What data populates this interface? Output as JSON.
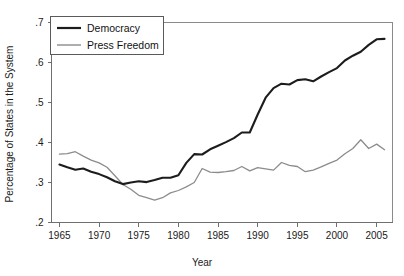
{
  "chart_data": {
    "type": "line",
    "title": "",
    "xlabel": "Year",
    "ylabel": "Percentage of States in the System",
    "xlim": [
      1964,
      2007
    ],
    "ylim": [
      0.2,
      0.7
    ],
    "grid": false,
    "legend_position": "top-left",
    "xticks": [
      1965,
      1970,
      1975,
      1980,
      1985,
      1990,
      1995,
      2000,
      2005
    ],
    "xtick_labels": [
      "1965",
      "1970",
      "1975",
      "1980",
      "1985",
      "1990",
      "1995",
      "2000",
      "2005"
    ],
    "yticks": [
      0.2,
      0.3,
      0.4,
      0.5,
      0.6,
      0.7
    ],
    "ytick_labels": [
      ".2",
      ".3",
      ".4",
      ".5",
      ".6",
      ".7"
    ],
    "x": [
      1965,
      1966,
      1967,
      1968,
      1969,
      1970,
      1971,
      1972,
      1973,
      1974,
      1975,
      1976,
      1977,
      1978,
      1979,
      1980,
      1981,
      1982,
      1983,
      1984,
      1985,
      1986,
      1987,
      1988,
      1989,
      1990,
      1991,
      1992,
      1993,
      1994,
      1995,
      1996,
      1997,
      1998,
      1999,
      2000,
      2001,
      2002,
      2003,
      2004,
      2005,
      2006
    ],
    "series": [
      {
        "name": "Democracy",
        "color": "#1c1c1c",
        "values": [
          0.345,
          0.338,
          0.332,
          0.335,
          0.327,
          0.321,
          0.313,
          0.303,
          0.296,
          0.3,
          0.303,
          0.301,
          0.306,
          0.312,
          0.312,
          0.318,
          0.349,
          0.371,
          0.37,
          0.383,
          0.392,
          0.401,
          0.411,
          0.425,
          0.425,
          0.47,
          0.512,
          0.536,
          0.547,
          0.545,
          0.556,
          0.558,
          0.553,
          0.565,
          0.576,
          0.586,
          0.605,
          0.617,
          0.627,
          0.644,
          0.658,
          0.659
        ]
      },
      {
        "name": "Press Freedom",
        "color": "#8c8c8c",
        "values": [
          0.371,
          0.372,
          0.377,
          0.366,
          0.356,
          0.349,
          0.338,
          0.317,
          0.295,
          0.283,
          0.268,
          0.262,
          0.256,
          0.262,
          0.274,
          0.28,
          0.289,
          0.3,
          0.335,
          0.326,
          0.325,
          0.327,
          0.33,
          0.34,
          0.329,
          0.337,
          0.334,
          0.331,
          0.35,
          0.343,
          0.34,
          0.327,
          0.331,
          0.339,
          0.348,
          0.356,
          0.372,
          0.385,
          0.407,
          0.385,
          0.396,
          0.382
        ]
      }
    ]
  },
  "legend": {
    "items": [
      {
        "label": "Democracy",
        "style": "thick-black"
      },
      {
        "label": "Press Freedom",
        "style": "thin-gray"
      }
    ]
  },
  "axes": {
    "x_title": "Year",
    "y_title": "Percentage of States in the System"
  },
  "colors": {
    "democracy": "#1c1c1c",
    "press_freedom": "#8c8c8c",
    "axis": "#6f6f6f",
    "frame": "#8a8a8a",
    "text": "#1a1a1a",
    "background": "#ffffff"
  }
}
